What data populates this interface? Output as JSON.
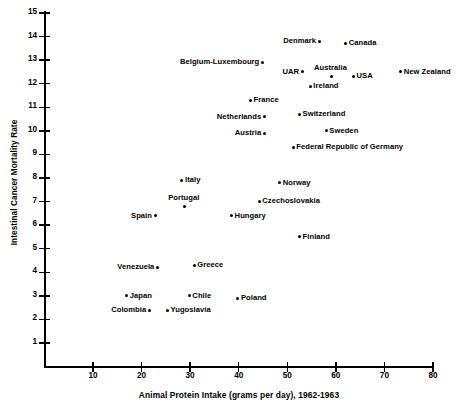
{
  "chart_data": {
    "type": "scatter",
    "title": "",
    "xlabel": "Animal Protein Intake (grams per day), 1962-1963",
    "ylabel": "Intestinal Cancer Mortality Rate",
    "xlim": [
      3,
      80
    ],
    "ylim": [
      0.3,
      15
    ],
    "xticks": [
      10,
      20,
      30,
      40,
      50,
      60,
      70,
      80
    ],
    "yticks": [
      1,
      2,
      3,
      4,
      5,
      6,
      7,
      8,
      9,
      10,
      11,
      12,
      13,
      14,
      15
    ],
    "grid": false,
    "legend": "none",
    "marker": "filled-circle",
    "points": [
      {
        "label": "Denmark",
        "x": 56.6,
        "y": 13.8,
        "label_side": "left"
      },
      {
        "label": "Canada",
        "x": 62.0,
        "y": 13.7,
        "label_side": "right"
      },
      {
        "label": "Belgium-Luxembourg",
        "x": 44.9,
        "y": 12.9,
        "label_side": "left"
      },
      {
        "label": "UAR",
        "x": 53.1,
        "y": 12.5,
        "label_side": "left"
      },
      {
        "label": "Australia",
        "x": 59.1,
        "y": 12.3,
        "label_side": "above"
      },
      {
        "label": "USA",
        "x": 63.6,
        "y": 12.3,
        "label_side": "right"
      },
      {
        "label": "New Zealand",
        "x": 73.3,
        "y": 12.5,
        "label_side": "right"
      },
      {
        "label": "Ireland",
        "x": 54.7,
        "y": 11.9,
        "label_side": "right"
      },
      {
        "label": "France",
        "x": 42.4,
        "y": 11.3,
        "label_side": "right"
      },
      {
        "label": "Switzerland",
        "x": 52.5,
        "y": 10.7,
        "label_side": "right"
      },
      {
        "label": "Netherlands",
        "x": 45.3,
        "y": 10.6,
        "label_side": "left"
      },
      {
        "label": "Sweden",
        "x": 58.0,
        "y": 10.0,
        "label_side": "right"
      },
      {
        "label": "Austria",
        "x": 45.3,
        "y": 9.9,
        "label_side": "left"
      },
      {
        "label": "Federal Republic of Germany",
        "x": 51.2,
        "y": 9.3,
        "label_side": "right"
      },
      {
        "label": "Italy",
        "x": 28.3,
        "y": 7.9,
        "label_side": "right"
      },
      {
        "label": "Norway",
        "x": 48.4,
        "y": 7.8,
        "label_side": "right"
      },
      {
        "label": "Czechoslovakia",
        "x": 44.2,
        "y": 7.0,
        "label_side": "right"
      },
      {
        "label": "Portugal",
        "x": 28.9,
        "y": 6.8,
        "label_side": "above"
      },
      {
        "label": "Spain",
        "x": 22.8,
        "y": 6.4,
        "label_side": "left"
      },
      {
        "label": "Hungary",
        "x": 38.5,
        "y": 6.4,
        "label_side": "right"
      },
      {
        "label": "Finland",
        "x": 52.5,
        "y": 5.5,
        "label_side": "right"
      },
      {
        "label": "Greece",
        "x": 30.8,
        "y": 4.3,
        "label_side": "right"
      },
      {
        "label": "Venezuela",
        "x": 23.3,
        "y": 4.2,
        "label_side": "left"
      },
      {
        "label": "Japan",
        "x": 16.9,
        "y": 3.0,
        "label_side": "right"
      },
      {
        "label": "Chile",
        "x": 29.8,
        "y": 3.0,
        "label_side": "right"
      },
      {
        "label": "Poland",
        "x": 39.8,
        "y": 2.9,
        "label_side": "right"
      },
      {
        "label": "Colombia",
        "x": 21.6,
        "y": 2.4,
        "label_side": "left"
      },
      {
        "label": "Yugoslavia",
        "x": 25.3,
        "y": 2.4,
        "label_side": "right"
      }
    ]
  },
  "axes": {
    "x_tick_labels": [
      "10",
      "20",
      "30",
      "40",
      "50",
      "60",
      "70",
      "80"
    ],
    "y_tick_labels": [
      "1",
      "2",
      "3",
      "4",
      "5",
      "6",
      "7",
      "8",
      "9",
      "10",
      "11",
      "12",
      "13",
      "14",
      "15"
    ]
  },
  "colors": {
    "ink": "#000000",
    "paper": "#ffffff"
  }
}
